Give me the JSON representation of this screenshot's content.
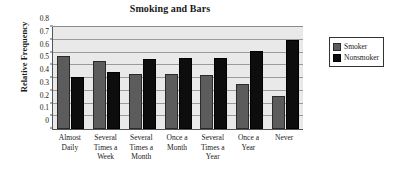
{
  "chart_data": {
    "type": "bar",
    "title": "Smoking and Bars",
    "xlabel": "",
    "ylabel": "Relative Frequency",
    "categories": [
      "Almost Daily",
      "Several Times a Week",
      "Several Times a Month",
      "Once a Month",
      "Several Times a Year",
      "Once a Year",
      "Never"
    ],
    "category_lines": [
      [
        "Almost",
        "Daily"
      ],
      [
        "Several",
        "Times a",
        "Week"
      ],
      [
        "Several",
        "Times a",
        "Month"
      ],
      [
        "Once a",
        "Month"
      ],
      [
        "Several",
        "Times a",
        "Year"
      ],
      [
        "Once a",
        "Year"
      ],
      [
        "Never"
      ]
    ],
    "series": [
      {
        "name": "Smoker",
        "color": "#5c5c5c",
        "values": [
          0.575,
          0.53,
          0.43,
          0.43,
          0.42,
          0.355,
          0.26
        ]
      },
      {
        "name": "Nonsmoker",
        "color": "#0d0d0d",
        "values": [
          0.41,
          0.45,
          0.55,
          0.555,
          0.56,
          0.615,
          0.7
        ]
      }
    ],
    "ylim": [
      0,
      0.8
    ],
    "yticks": [
      "0",
      "0.1",
      "0.2",
      "0.3",
      "0.4",
      "0.5",
      "0.6",
      "0.7",
      "0.8"
    ],
    "ytick_values": [
      0,
      0.1,
      0.2,
      0.3,
      0.4,
      0.5,
      0.6,
      0.7,
      0.8
    ],
    "grid": true,
    "legend_position": "right",
    "plot_background": "#e9e9e9",
    "gridline_color": "#9a9a9a"
  },
  "legend": {
    "items": [
      {
        "label": "Smoker"
      },
      {
        "label": "Nonsmoker"
      }
    ]
  }
}
